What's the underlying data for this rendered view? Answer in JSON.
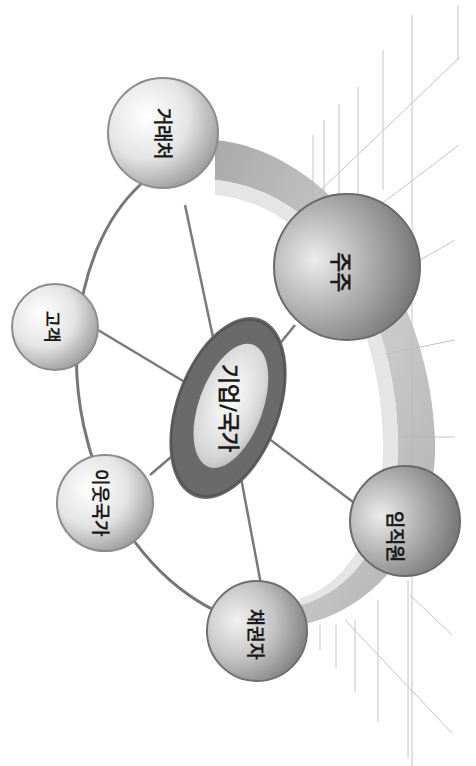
{
  "diagram": {
    "type": "stakeholder-hub",
    "orientation": "rotated-90-clockwise",
    "center": {
      "label": "기업/국가",
      "x": 228,
      "y": 408
    },
    "nodes": [
      {
        "id": "partner",
        "label": "거래처",
        "x": 163,
        "y": 133,
        "r": 55
      },
      {
        "id": "customer",
        "label": "고객",
        "x": 55,
        "y": 327,
        "r": 43
      },
      {
        "id": "neighbor",
        "label": "이웃국가",
        "x": 105,
        "y": 503,
        "r": 48
      },
      {
        "id": "creditor",
        "label": "채권자",
        "x": 257,
        "y": 631,
        "r": 50
      },
      {
        "id": "employee",
        "label": "임직원",
        "x": 405,
        "y": 521,
        "r": 55
      },
      {
        "id": "shareholder",
        "label": "주주",
        "x": 347,
        "y": 267,
        "r": 73
      }
    ],
    "colors": {
      "ring_dark": "#6e6e6e",
      "band": "#a9a9a9",
      "band_light": "#dcdcdc",
      "line": "#7a7a7a",
      "grid": "#bdbdbd",
      "text": "#1a1a1a"
    }
  }
}
